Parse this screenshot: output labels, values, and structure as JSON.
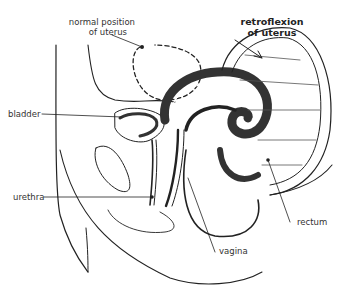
{
  "diagram": {
    "title": "retroflexion of uterus",
    "labels": {
      "normal_position_line1": "normal position",
      "normal_position_line2": "of uterus",
      "retroflexion_line1": "retroflexion",
      "retroflexion_line2": "of uterus",
      "bladder": "bladder",
      "urethra": "urethra",
      "vagina": "vagina",
      "rectum": "rectum"
    },
    "colors": {
      "line": "#222222",
      "text": "#333333",
      "background": "#ffffff"
    }
  }
}
